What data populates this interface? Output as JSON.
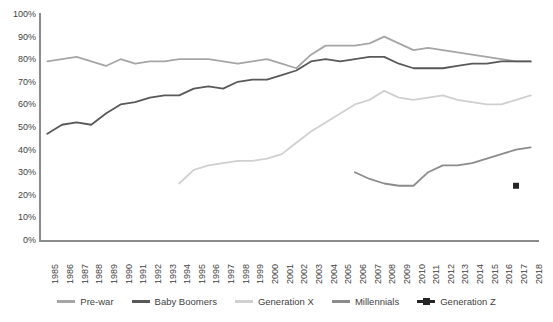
{
  "chart_data": {
    "type": "line",
    "title": "",
    "xlabel": "",
    "ylabel": "",
    "ylim": [
      0,
      100
    ],
    "y_tick_labels": [
      "100%",
      "90%",
      "80%",
      "70%",
      "60%",
      "50%",
      "40%",
      "30%",
      "20%",
      "10%",
      "0%"
    ],
    "y_ticks": [
      100,
      90,
      80,
      70,
      60,
      50,
      40,
      30,
      20,
      10,
      0
    ],
    "grid": false,
    "legend_position": "bottom",
    "categories": [
      "1985",
      "1986",
      "1987",
      "1988",
      "1989",
      "1990",
      "1991",
      "1992",
      "1993",
      "1994",
      "1995",
      "1996",
      "1997",
      "1998",
      "1999",
      "2000",
      "2001",
      "2002",
      "2003",
      "2004",
      "2005",
      "2006",
      "2007",
      "2008",
      "2009",
      "2010",
      "2011",
      "2012",
      "2013",
      "2014",
      "2015",
      "2016",
      "2017",
      "2018"
    ],
    "series": [
      {
        "name": "Pre-war",
        "color": "#a6a6a6",
        "marker": false,
        "values": [
          79,
          80,
          81,
          79,
          77,
          80,
          78,
          79,
          79,
          80,
          80,
          80,
          79,
          78,
          79,
          80,
          78,
          76,
          82,
          86,
          86,
          86,
          87,
          90,
          87,
          84,
          85,
          84,
          83,
          82,
          81,
          80,
          79,
          79
        ]
      },
      {
        "name": "Baby Boomers",
        "color": "#595959",
        "marker": false,
        "values": [
          47,
          51,
          52,
          51,
          56,
          60,
          61,
          63,
          64,
          64,
          67,
          68,
          67,
          70,
          71,
          71,
          73,
          75,
          79,
          80,
          79,
          80,
          81,
          81,
          78,
          76,
          76,
          76,
          77,
          78,
          78,
          79,
          79,
          79
        ]
      },
      {
        "name": "Generation X",
        "color": "#d0d0d0",
        "marker": false,
        "values": [
          null,
          null,
          null,
          null,
          null,
          null,
          null,
          null,
          null,
          25,
          31,
          33,
          34,
          35,
          35,
          36,
          38,
          43,
          48,
          52,
          56,
          60,
          62,
          66,
          63,
          62,
          63,
          64,
          62,
          61,
          60,
          60,
          62,
          64
        ]
      },
      {
        "name": "Millennials",
        "color": "#8c8c8c",
        "marker": false,
        "values": [
          null,
          null,
          null,
          null,
          null,
          null,
          null,
          null,
          null,
          null,
          null,
          null,
          null,
          null,
          null,
          null,
          null,
          null,
          null,
          null,
          null,
          30,
          27,
          25,
          24,
          24,
          30,
          33,
          33,
          34,
          36,
          38,
          40,
          41
        ]
      },
      {
        "name": "Generation Z",
        "color": "#262626",
        "marker": true,
        "values": [
          null,
          null,
          null,
          null,
          null,
          null,
          null,
          null,
          null,
          null,
          null,
          null,
          null,
          null,
          null,
          null,
          null,
          null,
          null,
          null,
          null,
          null,
          null,
          null,
          null,
          null,
          null,
          null,
          null,
          null,
          null,
          null,
          24,
          null
        ]
      }
    ]
  }
}
